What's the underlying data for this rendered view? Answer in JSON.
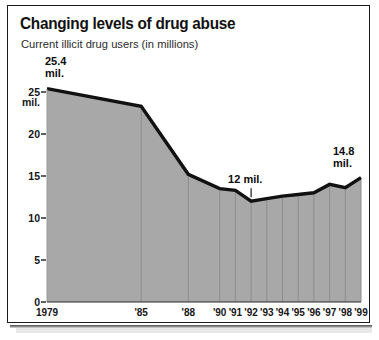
{
  "figure": {
    "title": "Changing levels of drug abuse",
    "subtitle": "Current illicit drug users (in millions)"
  },
  "colors": {
    "frame": "#1a1a1a",
    "area_fill": "#a8a8a8",
    "line": "#111111",
    "divider": "#8d8d8d",
    "text": "#161616"
  },
  "chart_data": {
    "type": "area",
    "title": "Changing levels of drug abuse",
    "subtitle": "Current illicit drug users (in millions)",
    "xlabel": "",
    "ylabel": "",
    "ylim": [
      0,
      26
    ],
    "xlim": [
      1979,
      1999
    ],
    "grid": false,
    "legend": "none",
    "yticks": [
      0,
      5,
      10,
      15,
      20,
      25
    ],
    "ytick_labels": [
      "0",
      "5",
      "10",
      "15",
      "20",
      "25"
    ],
    "y_unit_label": "mil.",
    "categories": [
      "1979",
      "'85",
      "'88",
      "'90",
      "'91",
      "'92",
      "'93",
      "'94",
      "'95",
      "'96",
      "'97",
      "'98",
      "'99"
    ],
    "x_values": [
      1979,
      1985,
      1988,
      1990,
      1991,
      1992,
      1993,
      1994,
      1995,
      1996,
      1997,
      1998,
      1999
    ],
    "values": [
      25.4,
      23.3,
      15.2,
      13.5,
      13.3,
      12.0,
      12.3,
      12.6,
      12.8,
      13.0,
      14.0,
      13.6,
      14.8
    ],
    "series": [
      {
        "name": "Current illicit drug users (in millions)",
        "values": [
          25.4,
          23.3,
          15.2,
          13.5,
          13.3,
          12.0,
          12.3,
          12.6,
          12.8,
          13.0,
          14.0,
          13.6,
          14.8
        ]
      }
    ],
    "annotations": [
      {
        "id": "start",
        "text_line1": "25.4",
        "text_line2": "mil.",
        "x": "1979",
        "value": 25.4,
        "leader": false
      },
      {
        "id": "minimum",
        "text_line1": "12 mil.",
        "text_line2": "",
        "x": "'92",
        "value": 12.0,
        "leader": true
      },
      {
        "id": "end",
        "text_line1": "14.8",
        "text_line2": "mil.",
        "x": "'99",
        "value": 14.8,
        "leader": false
      }
    ]
  }
}
